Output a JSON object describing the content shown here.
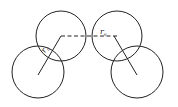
{
  "diagram": {
    "labels": {
      "left": {
        "main": "r",
        "sub": "c"
      },
      "right": {
        "main": "r",
        "sub": "v"
      }
    },
    "colors": {
      "stroke": "#222222",
      "background": "#ffffff"
    }
  }
}
